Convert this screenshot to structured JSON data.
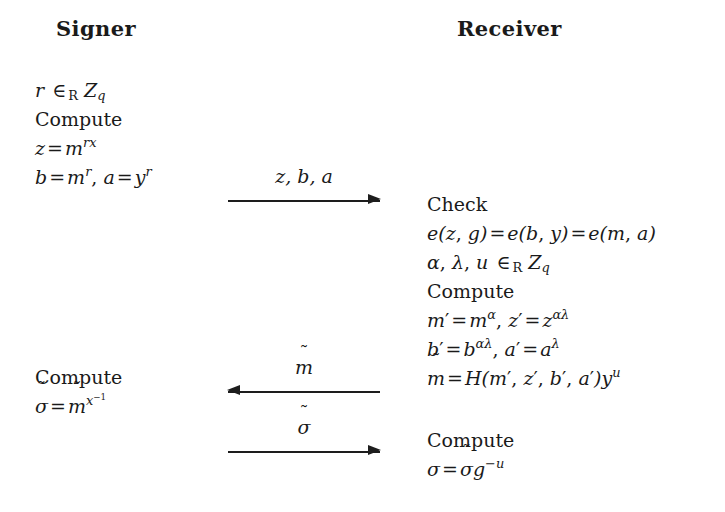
{
  "diagram": {
    "title_left": "Signer",
    "title_right": "Receiver",
    "background_color": "#ffffff",
    "ink_color": "#1a1a1a"
  },
  "signer": {
    "header": "Signer",
    "block_1": {
      "lines": [
        "r ∈R Zq",
        "Compute",
        "z = m^(rx)",
        "b = m^r, a = y^r"
      ]
    },
    "block_2": {
      "lines": [
        "Compute",
        "σ̃ = m̃^(x^-1)"
      ]
    }
  },
  "receiver": {
    "header": "Receiver",
    "block_1": {
      "lines": [
        "Check",
        "e(z, g) = e(b, y) = e(m, a)",
        "α, λ, u ∈R Zq",
        "Compute",
        "m′ = m^α, z′ = z^(αλ)",
        "b′ = b^(αλ), a′ = a^λ",
        "m̃ = H(m′, z′, b′, a′)y^u"
      ]
    },
    "block_2": {
      "lines": [
        "Compute",
        "σ = σ̃ g^(-u)"
      ]
    }
  },
  "messages": [
    {
      "label": "z, b, a",
      "direction": "right",
      "from": "Signer",
      "to": "Receiver"
    },
    {
      "label": "m̃",
      "direction": "left",
      "from": "Receiver",
      "to": "Signer"
    },
    {
      "label": "σ̃",
      "direction": "right",
      "from": "Signer",
      "to": "Receiver"
    }
  ],
  "symbols": {
    "tilde": "̃",
    "in_random": "∈",
    "alpha": "α",
    "lambda": "λ",
    "sigma": "σ",
    "prime": "′",
    "minus": "−"
  }
}
